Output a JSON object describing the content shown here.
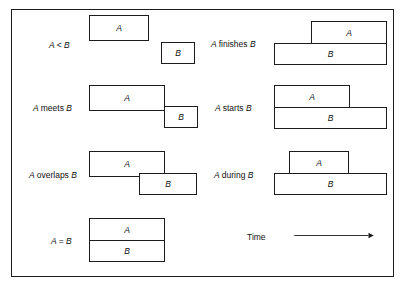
{
  "figure": {
    "title_text": "",
    "axis": {
      "time_label": "Time",
      "arrow_icon": "right-arrow-icon",
      "direction": "left-to-right"
    },
    "colors": {
      "stroke": "#1c1c1c",
      "fill": "#ffffff",
      "text": "#111111",
      "background": "#ffffff"
    }
  },
  "relations": [
    {
      "id": "before",
      "label_parts": {
        "a": "A",
        "op": "<",
        "b": "B"
      },
      "label": "A < B",
      "column": "left",
      "row": 1,
      "intervals": [
        {
          "name": "A",
          "x": 88,
          "y": 14,
          "w": 60,
          "h": 26
        },
        {
          "name": "B",
          "x": 160,
          "y": 41,
          "w": 34,
          "h": 22
        }
      ]
    },
    {
      "id": "meets",
      "label_parts": {
        "a": "A",
        "word": "meets",
        "b": "B"
      },
      "label": "A meets B",
      "column": "left",
      "row": 2,
      "intervals": [
        {
          "name": "A",
          "x": 88,
          "y": 84,
          "w": 76,
          "h": 26
        },
        {
          "name": "B",
          "x": 163,
          "y": 105,
          "w": 34,
          "h": 22
        }
      ]
    },
    {
      "id": "overlaps",
      "label_parts": {
        "a": "A",
        "word": "overlaps",
        "b": "B"
      },
      "label": "A overlaps B",
      "column": "left",
      "row": 3,
      "intervals": [
        {
          "name": "A",
          "x": 88,
          "y": 150,
          "w": 76,
          "h": 26
        },
        {
          "name": "B",
          "x": 138,
          "y": 172,
          "w": 58,
          "h": 22
        }
      ]
    },
    {
      "id": "equals",
      "label_parts": {
        "a": "A",
        "op": "=",
        "b": "B"
      },
      "label": "A = B",
      "column": "left",
      "row": 4,
      "intervals": [
        {
          "name": "A",
          "x": 88,
          "y": 217,
          "w": 76,
          "h": 22
        },
        {
          "name": "B",
          "x": 88,
          "y": 239,
          "w": 76,
          "h": 22
        }
      ]
    },
    {
      "id": "finishes",
      "label_parts": {
        "a": "A",
        "word": "finishes",
        "b": "B"
      },
      "label": "A finishes B",
      "column": "right",
      "row": 1,
      "intervals": [
        {
          "name": "A",
          "x": 310,
          "y": 20,
          "w": 76,
          "h": 22
        },
        {
          "name": "B",
          "x": 273,
          "y": 42,
          "w": 113,
          "h": 22
        }
      ]
    },
    {
      "id": "starts",
      "label_parts": {
        "a": "A",
        "word": "starts",
        "b": "B"
      },
      "label": "A starts B",
      "column": "right",
      "row": 2,
      "intervals": [
        {
          "name": "A",
          "x": 273,
          "y": 84,
          "w": 76,
          "h": 22
        },
        {
          "name": "B",
          "x": 273,
          "y": 106,
          "w": 113,
          "h": 22
        }
      ]
    },
    {
      "id": "during",
      "label_parts": {
        "a": "A",
        "word": "during",
        "b": "B"
      },
      "label": "A during B",
      "column": "right",
      "row": 3,
      "intervals": [
        {
          "name": "A",
          "x": 288,
          "y": 150,
          "w": 60,
          "h": 22
        },
        {
          "name": "B",
          "x": 273,
          "y": 172,
          "w": 113,
          "h": 22
        }
      ]
    }
  ],
  "labels": {
    "before": {
      "x": 48,
      "y": 40
    },
    "meets": {
      "x": 32,
      "y": 103
    },
    "overlaps": {
      "x": 28,
      "y": 170
    },
    "equals": {
      "x": 50,
      "y": 236
    },
    "finishes": {
      "x": 210,
      "y": 39
    },
    "starts": {
      "x": 214,
      "y": 103
    },
    "during": {
      "x": 213,
      "y": 170
    },
    "time": {
      "x": 246,
      "y": 232
    }
  }
}
